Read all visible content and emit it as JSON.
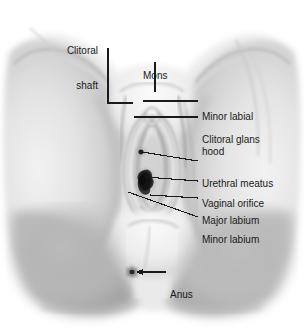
{
  "figure": {
    "style": "grayscale pencil/stipple medical drawing",
    "background_color": "#ffffff",
    "ink_color": "#1a1a1a",
    "width": 304,
    "height": 330
  },
  "labels": [
    {
      "id": "clitoral-shaft",
      "text": "Clitoral\nshaft",
      "line1": "Clitoral",
      "line2": "shaft",
      "side": "top-left",
      "text_x": 93,
      "text_y": 22,
      "align": "right",
      "leader": {
        "type": "elbow",
        "points": "108,48 108,103 133,103"
      }
    },
    {
      "id": "mons",
      "text": "Mons",
      "line1": "Mons",
      "line2": "",
      "side": "top-center",
      "text_x": 143,
      "text_y": 47,
      "align": "left",
      "leader": {
        "type": "vertical",
        "points": "155,62 155,92"
      }
    },
    {
      "id": "minor-labial-hood",
      "text": "Minor labial\nhood",
      "line1": "Minor labial",
      "line2": "hood",
      "side": "right",
      "text_x": 202,
      "text_y": 88,
      "align": "left",
      "leader": {
        "type": "horizontal",
        "points": "143,101 198,101"
      }
    },
    {
      "id": "clitoral-glans",
      "text": "Clitoral glans",
      "line1": "Clitoral glans",
      "line2": "",
      "side": "right",
      "text_x": 202,
      "text_y": 111,
      "align": "left",
      "leader": {
        "type": "horizontal",
        "points": "134,117 198,117"
      }
    },
    {
      "id": "urethral-meatus",
      "text": "Urethral meatus",
      "line1": "Urethral meatus",
      "line2": "",
      "side": "right",
      "text_x": 202,
      "text_y": 155,
      "align": "left",
      "leader": {
        "type": "diagonal",
        "points": "141,152 198,161"
      }
    },
    {
      "id": "vaginal-orifice",
      "text": "Vaginal orifice",
      "line1": "Vaginal orifice",
      "line2": "",
      "side": "right",
      "text_x": 202,
      "text_y": 174,
      "align": "left",
      "leader": {
        "type": "diagonal",
        "points": "143,176 198,180"
      }
    },
    {
      "id": "major-labium",
      "text": "Major labium",
      "line1": "Major labium",
      "line2": "",
      "side": "right",
      "text_x": 202,
      "text_y": 192,
      "align": "left",
      "leader": {
        "type": "horizontal",
        "points": "148,195 198,198"
      }
    },
    {
      "id": "minor-labium",
      "text": "Minor labium",
      "line1": "Minor labium",
      "line2": "",
      "side": "right",
      "text_x": 202,
      "text_y": 211,
      "align": "left",
      "leader": {
        "type": "diagonal",
        "points": "128,192 198,217"
      }
    },
    {
      "id": "anus",
      "text": "Anus",
      "line1": "Anus",
      "line2": "",
      "side": "right-lower",
      "text_x": 170,
      "text_y": 267,
      "align": "left",
      "leader": {
        "type": "arrow",
        "points": "166,273 133,273"
      }
    }
  ],
  "anatomy_features": [
    {
      "id": "left-thigh",
      "name": "Left thigh"
    },
    {
      "id": "right-thigh",
      "name": "Right thigh"
    },
    {
      "id": "mons-pubis",
      "name": "Mons pubis"
    },
    {
      "id": "labia-majora",
      "name": "Major labia"
    },
    {
      "id": "labia-minora",
      "name": "Minor labia"
    },
    {
      "id": "clitoral-hood",
      "name": "Clitoral hood"
    },
    {
      "id": "clitoral-glans-mark",
      "name": "Clitoral glans"
    },
    {
      "id": "urethral-opening",
      "name": "Urethral meatus opening"
    },
    {
      "id": "vaginal-opening",
      "name": "Vaginal orifice opening"
    },
    {
      "id": "perineum",
      "name": "Perineum"
    },
    {
      "id": "anus-mark",
      "name": "Anus"
    },
    {
      "id": "buttocks",
      "name": "Buttocks"
    }
  ]
}
